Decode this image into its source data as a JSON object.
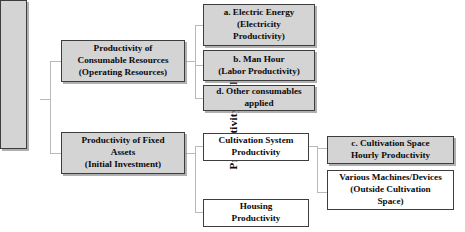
{
  "diagram": {
    "root": {
      "label": "Productivity of PFAL"
    },
    "level2": [
      {
        "id": "consumable-resources",
        "line1": "Productivity of",
        "line2": "Consumable  Resources",
        "line3": "(Operating Resources)"
      },
      {
        "id": "fixed-assets",
        "line1": "Productivity of Fixed",
        "line2": "Assets",
        "line3": "(Initial Investment)"
      }
    ],
    "level3": [
      {
        "id": "electric-energy",
        "line1": "a. Electric Energy",
        "line2": "(Electricity",
        "line3": "Productivity)"
      },
      {
        "id": "man-hour",
        "line1": "b. Man Hour",
        "line2": "(Labor Productivity)",
        "line3": ""
      },
      {
        "id": "other-consumables",
        "line1": "d. Other consumables",
        "line2": "applied",
        "line3": ""
      },
      {
        "id": "cultivation-system",
        "line1": "Cultivation System",
        "line2": "Productivity",
        "line3": ""
      },
      {
        "id": "housing",
        "line1": "Housing",
        "line2": "Productivity",
        "line3": ""
      }
    ],
    "level4": [
      {
        "id": "cultivation-space-hourly",
        "line1": "c. Cultivation Space",
        "line2": "Hourly Productivity",
        "line3": ""
      },
      {
        "id": "various-machines-devices",
        "line1": "Various Machines/Devices",
        "line2": "(Outside Cultivation",
        "line3": "Space)"
      }
    ],
    "colors": {
      "box_fill_gray": "#d4d4d4",
      "box_fill_white": "#ffffff",
      "box_border": "#3d3d3d",
      "connector": "#b9b9b9",
      "text": "#0b0b0b",
      "background": "#ffffff"
    }
  }
}
